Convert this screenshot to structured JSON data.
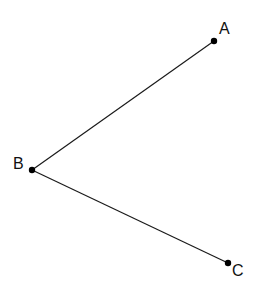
{
  "diagram": {
    "type": "angle",
    "stroke_color": "#1a1a1a",
    "point_color": "#000000",
    "background": "#ffffff",
    "points": [
      {
        "id": "A",
        "label": "A",
        "x": 214,
        "y": 41,
        "label_x": 219,
        "label_y": 34
      },
      {
        "id": "B",
        "label": "B",
        "x": 32,
        "y": 170,
        "label_x": 13,
        "label_y": 169
      },
      {
        "id": "C",
        "label": "C",
        "x": 228,
        "y": 263,
        "label_x": 232,
        "label_y": 276
      }
    ],
    "segments": [
      {
        "from": "B",
        "to": "A"
      },
      {
        "from": "B",
        "to": "C"
      }
    ]
  }
}
